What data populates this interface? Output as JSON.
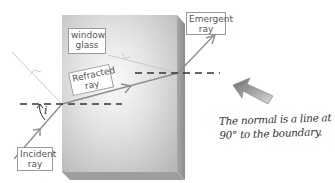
{
  "diagram": {
    "block_label": {
      "line1": "window",
      "line2": "glass"
    },
    "labels": {
      "refracted": {
        "line1": "Refracted",
        "line2": "ray"
      },
      "emergent": {
        "line1": "Emergent",
        "line2": "ray"
      },
      "incident": {
        "line1": "Incident",
        "line2": "ray"
      },
      "angle_symbol": "i"
    },
    "note": {
      "line1": "The normal is a line at",
      "line2": "90° to the boundary."
    },
    "colors": {
      "block_face": "#c8c8c8",
      "block_highlight": "#f4f4f4",
      "block_side": "#9a9a9a",
      "ray": "#9a9a9a",
      "normal": "#333333",
      "arrow": "#8a8a8a"
    }
  }
}
